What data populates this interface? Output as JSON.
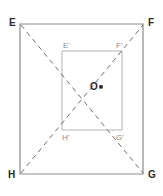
{
  "figure": {
    "background_color": "#ffffff",
    "outer": {
      "name": "outer-quadrilateral",
      "stroke_color": "#8c8c8c",
      "stroke_width": 1.2,
      "points": "20,24 143,24 143,174 20,174",
      "vertices": [
        {
          "id": "E",
          "label": "E",
          "x": 20,
          "y": 24,
          "label_x": 9,
          "label_y": 18
        },
        {
          "id": "F",
          "label": "F",
          "x": 143,
          "y": 24,
          "label_x": 148,
          "label_y": 18
        },
        {
          "id": "G",
          "label": "G",
          "x": 143,
          "y": 174,
          "label_x": 148,
          "label_y": 170
        },
        {
          "id": "H",
          "label": "H",
          "x": 20,
          "y": 174,
          "label_x": 8,
          "label_y": 170
        }
      ]
    },
    "inner": {
      "name": "inner-rectangle",
      "stroke_color": "#b4b4b4",
      "stroke_width": 1,
      "points": "62,51 122,51 122,130 62,130",
      "vertices": [
        {
          "id": "E1",
          "label": "E'",
          "x": 62,
          "y": 51,
          "label_x": 63,
          "label_y": 42
        },
        {
          "id": "F1",
          "label": "F'",
          "x": 122,
          "y": 51,
          "label_x": 116,
          "label_y": 42
        },
        {
          "id": "G1",
          "label": "G'",
          "x": 122,
          "y": 130,
          "label_x": 116,
          "label_y": 134
        },
        {
          "id": "H1",
          "label": "H'",
          "x": 62,
          "y": 130,
          "label_x": 62,
          "label_y": 134
        }
      ]
    },
    "diagonals": [
      {
        "id": "diagonal-e-to-g",
        "from": "E",
        "to": "G",
        "x1": 21,
        "y1": 25,
        "x2": 143,
        "y2": 173,
        "stroke_color": "#6e6e6e",
        "stroke_width": 1,
        "dash": "5 4"
      },
      {
        "id": "diagonal-h-to-f",
        "from": "H",
        "to": "F",
        "x1": 21,
        "y1": 173,
        "x2": 143,
        "y2": 25,
        "stroke_color": "#6e6e6e",
        "stroke_width": 1,
        "dash": "5 4"
      }
    ],
    "center": {
      "id": "O",
      "label": "O",
      "x": 101,
      "y": 87,
      "label_x": 90,
      "label_y": 82,
      "marker_color": "#1f1f1f",
      "marker_size": 3
    }
  }
}
